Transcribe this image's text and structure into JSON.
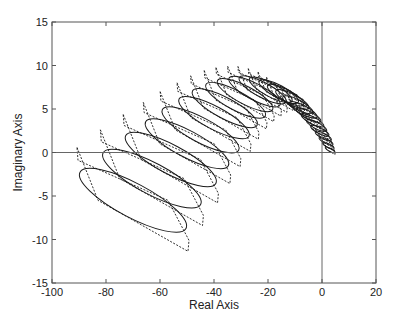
{
  "chart_data": {
    "type": "line",
    "title": "",
    "xlabel": "Real Axis",
    "ylabel": "Imaginary Axis",
    "xlim": [
      -100,
      20
    ],
    "ylim": [
      -15,
      15
    ],
    "xticks": [
      -100,
      -80,
      -60,
      -40,
      -20,
      0,
      20
    ],
    "yticks": [
      -15,
      -10,
      -5,
      0,
      5,
      10,
      15
    ],
    "xtick_labels": [
      "-100",
      "-80",
      "-60",
      "-40",
      "-20",
      "0",
      "20"
    ],
    "ytick_labels": [
      "-15",
      "-10",
      "-5",
      "0",
      "5",
      "10",
      "15"
    ],
    "grid": false,
    "legend": null,
    "reference_lines": {
      "x_zero": true,
      "y_zero": true
    },
    "series": [
      {
        "name": "uncertainty-polygons",
        "style": "dashed",
        "description": "Sequence of tilted hexagonal (diamond-like) uncertainty regions along an arc, shrinking from left to right"
      },
      {
        "name": "uncertainty-ellipses",
        "style": "solid",
        "description": "Ellipses inscribed in each polygon"
      }
    ],
    "shape_centers": [
      {
        "x": -70,
        "y": -5.5,
        "scale": 1.0
      },
      {
        "x": -63,
        "y": -3.0,
        "scale": 0.92
      },
      {
        "x": -56,
        "y": -0.8,
        "scale": 0.85
      },
      {
        "x": -50,
        "y": 1.0,
        "scale": 0.78
      },
      {
        "x": -45,
        "y": 2.6,
        "scale": 0.72
      },
      {
        "x": -40,
        "y": 4.0,
        "scale": 0.66
      },
      {
        "x": -36,
        "y": 5.1,
        "scale": 0.61
      },
      {
        "x": -32,
        "y": 6.0,
        "scale": 0.56
      },
      {
        "x": -28.5,
        "y": 6.6,
        "scale": 0.52
      },
      {
        "x": -25,
        "y": 7.0,
        "scale": 0.48
      },
      {
        "x": -22,
        "y": 7.2,
        "scale": 0.44
      },
      {
        "x": -19,
        "y": 7.2,
        "scale": 0.4
      },
      {
        "x": -16,
        "y": 7.0,
        "scale": 0.37
      },
      {
        "x": -13.5,
        "y": 6.6,
        "scale": 0.34
      },
      {
        "x": -11,
        "y": 6.1,
        "scale": 0.31
      },
      {
        "x": -9,
        "y": 5.5,
        "scale": 0.28
      },
      {
        "x": -7,
        "y": 4.9,
        "scale": 0.26
      },
      {
        "x": -5,
        "y": 4.3,
        "scale": 0.23
      },
      {
        "x": -3.5,
        "y": 3.7,
        "scale": 0.21
      },
      {
        "x": -2,
        "y": 3.1,
        "scale": 0.19
      },
      {
        "x": -0.8,
        "y": 2.5,
        "scale": 0.17
      },
      {
        "x": 0.5,
        "y": 1.9,
        "scale": 0.15
      },
      {
        "x": 1.5,
        "y": 1.3,
        "scale": 0.13
      },
      {
        "x": 2.3,
        "y": 0.8,
        "scale": 0.11
      },
      {
        "x": 3.0,
        "y": 0.3,
        "scale": 0.09
      }
    ]
  },
  "axes": {
    "x_label": "Real Axis",
    "y_label": "Imaginary Axis"
  },
  "colors": {
    "line": "#1a1a1a",
    "axis": "#555555",
    "background": "#ffffff"
  }
}
